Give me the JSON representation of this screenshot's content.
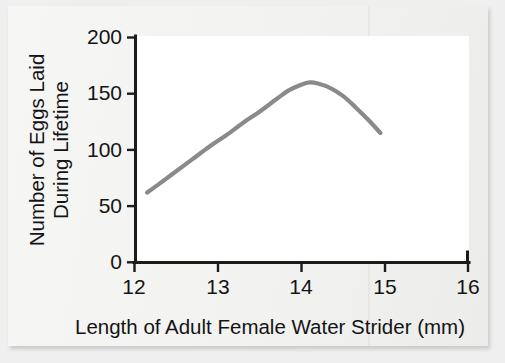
{
  "chart_data": {
    "type": "line",
    "title": "",
    "subtitle": "",
    "xlabel": "Length of Adult Female Water Strider (mm)",
    "ylabel_lines": [
      "Number of Eggs Laid",
      "During Lifetime"
    ],
    "ylabel": "Number of Eggs Laid During Lifetime",
    "xlim": [
      12,
      16
    ],
    "ylim": [
      0,
      200
    ],
    "xticks": [
      12,
      13,
      14,
      15,
      16
    ],
    "xtick_labels": [
      "12",
      "13",
      "14",
      "15",
      "16"
    ],
    "yticks": [
      0,
      50,
      100,
      150,
      200
    ],
    "ytick_labels": [
      "0",
      "50",
      "100",
      "150",
      "200"
    ],
    "grid": false,
    "legend": false,
    "legend_position": "none",
    "series": [
      {
        "name": "Eggs laid during lifetime",
        "color": "#8a8a8a",
        "x": [
          12.15,
          12.3,
          12.5,
          12.7,
          12.9,
          13.1,
          13.3,
          13.5,
          13.7,
          13.85,
          14.0,
          14.1,
          14.2,
          14.35,
          14.5,
          14.65,
          14.8,
          14.95
        ],
        "values": [
          62,
          70,
          81,
          92,
          103,
          113,
          124,
          134,
          145,
          153,
          158,
          160,
          159,
          155,
          148,
          138,
          127,
          115
        ]
      }
    ],
    "annotations": []
  },
  "axis": {
    "x_tick_labels": [
      "12",
      "13",
      "14",
      "15",
      "16"
    ],
    "y_tick_labels": [
      "200",
      "150",
      "100",
      "50",
      "0"
    ],
    "x_title": "Length of Adult Female Water Strider (mm)",
    "y_title_line1": "Number of Eggs Laid",
    "y_title_line2": "During Lifetime"
  },
  "colors": {
    "curve": "#8a8a8a",
    "axis": "#1b1b1b",
    "text": "#141414",
    "plot_background": "#ffffff",
    "page_background": "#f4f4f3",
    "outer_background": "#efefef"
  }
}
